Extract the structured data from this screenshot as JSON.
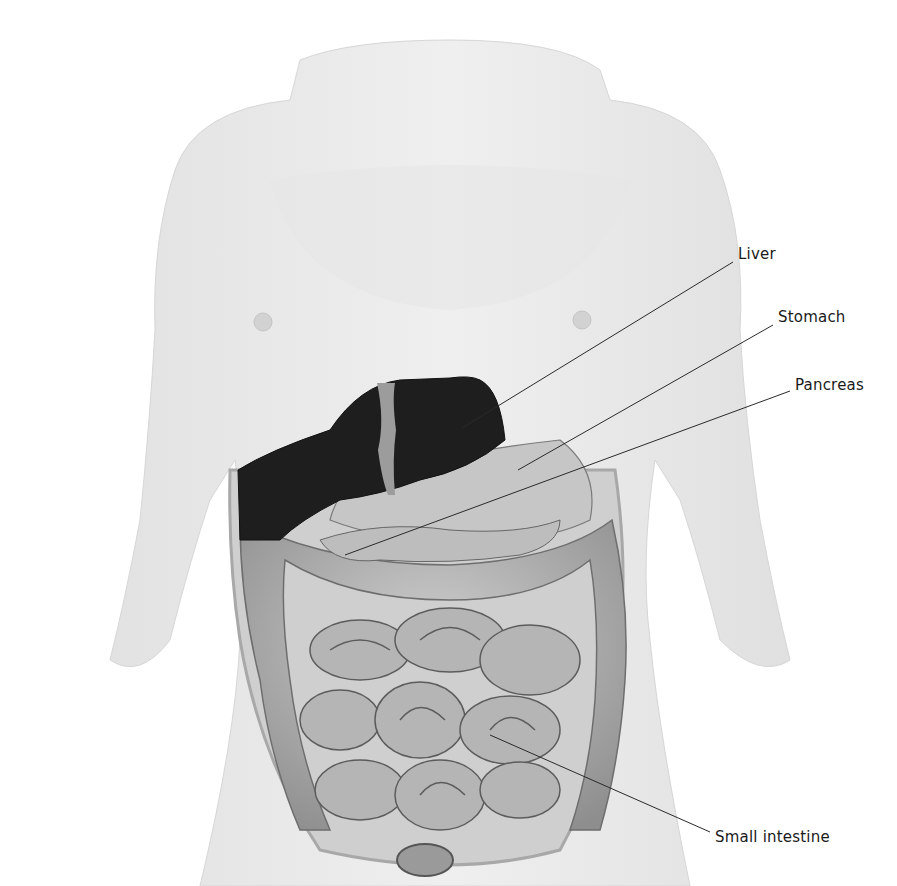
{
  "figure": {
    "colors": {
      "background": "#ffffff",
      "skin": "#ececec",
      "skin_shadow": "#dcdcdc",
      "liver": "#1e1e1e",
      "organs": "#b8b8b8",
      "organ_outline": "#6e6e6e",
      "leader_line": "#2a2a2a",
      "label_text": "#1a1a1a"
    },
    "labels": [
      {
        "id": "liver",
        "text": "Liver"
      },
      {
        "id": "stomach",
        "text": "Stomach"
      },
      {
        "id": "pancreas",
        "text": "Pancreas"
      },
      {
        "id": "small_intestine",
        "text": "Small intestine"
      }
    ]
  }
}
